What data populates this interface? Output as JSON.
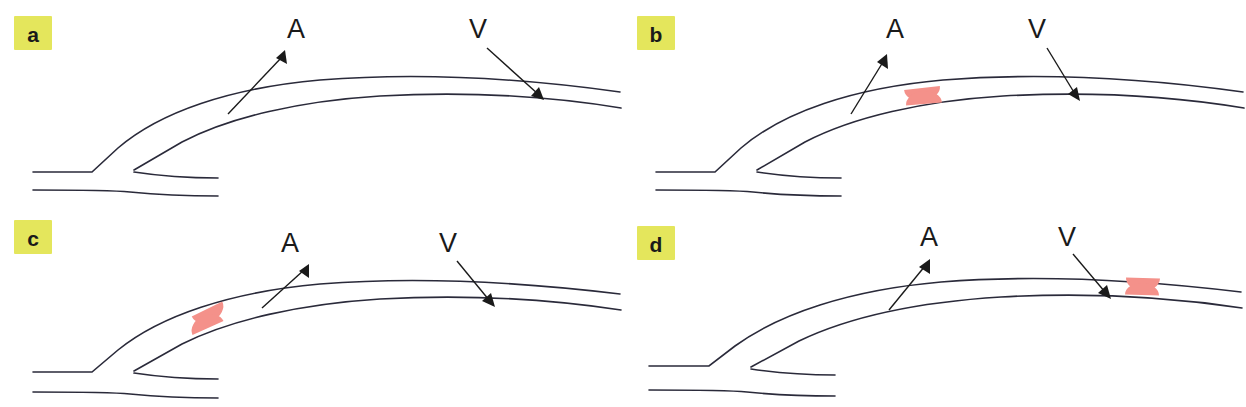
{
  "figure": {
    "background_color": "#ffffff",
    "width": 1246,
    "height": 407,
    "grid": {
      "rows": 2,
      "cols": 2
    }
  },
  "style": {
    "badge_fill": "#e4e65c",
    "badge_text_color": "#1a1a1a",
    "vessel_stroke": "#2a2a3a",
    "arrow_stroke": "#1a1a1a",
    "plaque_fill": "#f4918a",
    "plaque_stroke": "none"
  },
  "labels": {
    "artery": "A",
    "vein": "V"
  },
  "panels": [
    {
      "id": "a",
      "badge": "a",
      "artery_label": "A",
      "vein_label": "V",
      "plaque_present": false,
      "plaque_count": 0,
      "plaque_position": "none",
      "plaque_position_note": "no plaque shown"
    },
    {
      "id": "b",
      "badge": "b",
      "artery_label": "A",
      "vein_label": "V",
      "plaque_present": true,
      "plaque_count": 2,
      "plaque_position": "mid",
      "plaque_position_note": "paired half-disc plaques at mid segment of crossing vessel"
    },
    {
      "id": "c",
      "badge": "c",
      "artery_label": "A",
      "vein_label": "V",
      "plaque_present": true,
      "plaque_count": 2,
      "plaque_position": "proximal",
      "plaque_position_note": "paired half-disc plaques near proximal ascending limb"
    },
    {
      "id": "d",
      "badge": "d",
      "artery_label": "A",
      "vein_label": "V",
      "plaque_present": true,
      "plaque_count": 2,
      "plaque_position": "distal",
      "plaque_position_note": "paired half-disc plaques at distal segment"
    }
  ]
}
